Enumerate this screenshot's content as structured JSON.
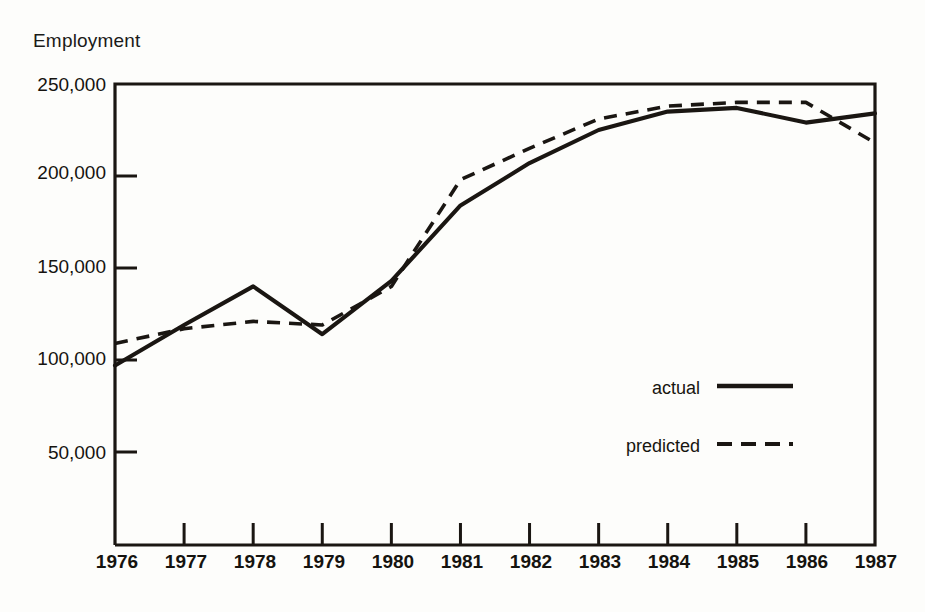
{
  "chart_data": {
    "type": "line",
    "title": "",
    "ylabel": "Employment",
    "xlabel": "",
    "categories": [
      "1976",
      "1977",
      "1978",
      "1979",
      "1980",
      "1981",
      "1982",
      "1983",
      "1984",
      "1985",
      "1986",
      "1987"
    ],
    "x": [
      1976,
      1977,
      1978,
      1979,
      1980,
      1981,
      1982,
      1983,
      1984,
      1985,
      1986,
      1987
    ],
    "ylim": [
      0,
      250000
    ],
    "yticks": [
      50000,
      100000,
      150000,
      200000,
      250000
    ],
    "ytick_labels": [
      "50,000",
      "100,000",
      "150,000",
      "200,000",
      "250,000"
    ],
    "grid": false,
    "legend_position": "inside-lower-right",
    "series": [
      {
        "name": "actual",
        "style": "solid",
        "color": "#1a1612",
        "values": [
          97000,
          119000,
          140000,
          114000,
          143000,
          184000,
          207000,
          225000,
          235000,
          237000,
          229000,
          234000
        ]
      },
      {
        "name": "predicted",
        "style": "dashed",
        "color": "#1a1612",
        "values": [
          109000,
          117000,
          121000,
          119000,
          140000,
          198000,
          215000,
          231000,
          238000,
          240000,
          240000,
          218000
        ]
      }
    ]
  },
  "axes": {
    "y_title": "Employment",
    "tick_labels_y": [
      "250,000",
      "200,000",
      "150,000",
      "100,000",
      "50,000"
    ],
    "tick_labels_x": [
      "1976",
      "1977",
      "1978",
      "1979",
      "1980",
      "1981",
      "1982",
      "1983",
      "1984",
      "1985",
      "1986",
      "1987"
    ]
  },
  "legend": {
    "entries": [
      {
        "label": "actual",
        "style": "solid"
      },
      {
        "label": "predicted",
        "style": "dashed"
      }
    ]
  },
  "colors": {
    "ink": "#1a1612",
    "paper": "#fdfdfb"
  }
}
